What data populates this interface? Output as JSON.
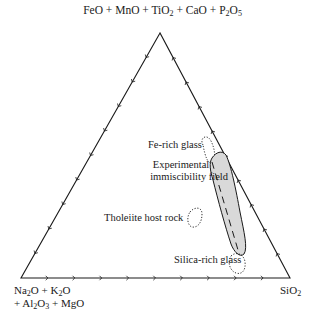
{
  "diagram": {
    "type": "ternary",
    "vertices": {
      "top": {
        "label_parts": [
          {
            "t": "FeO + MnO + TiO"
          },
          {
            "sub": "2"
          },
          {
            "t": " + CaO + P"
          },
          {
            "sub": "2"
          },
          {
            "t": "O"
          },
          {
            "sub": "5"
          }
        ],
        "label_text": "FeO + MnO + TiO2 + CaO + P2O5"
      },
      "bottom_left": {
        "line1_text": "Na2O + K2O",
        "line2_text": "+ Al2O3 + MgO"
      },
      "bottom_right": {
        "label_text": "SiO2"
      }
    },
    "ticks_per_side": 9,
    "fields": [
      {
        "id": "fe-rich-glass",
        "label": "Fe-rich glass",
        "style": "dotted"
      },
      {
        "id": "experimental-immiscibility-field",
        "label_line1": "Experimental",
        "label_line2": "immiscibility field",
        "style": "shaded-solid",
        "fill": "#d9d9d9"
      },
      {
        "id": "tholeiite-host-rock",
        "label": "Tholeiite host rock",
        "style": "dotted"
      },
      {
        "id": "silica-rich-glass",
        "label": "Silica-rich glass",
        "style": "dotted"
      }
    ],
    "colors": {
      "line": "#1a1a1a",
      "field_fill": "#d9d9d9",
      "background": "#ffffff"
    }
  }
}
